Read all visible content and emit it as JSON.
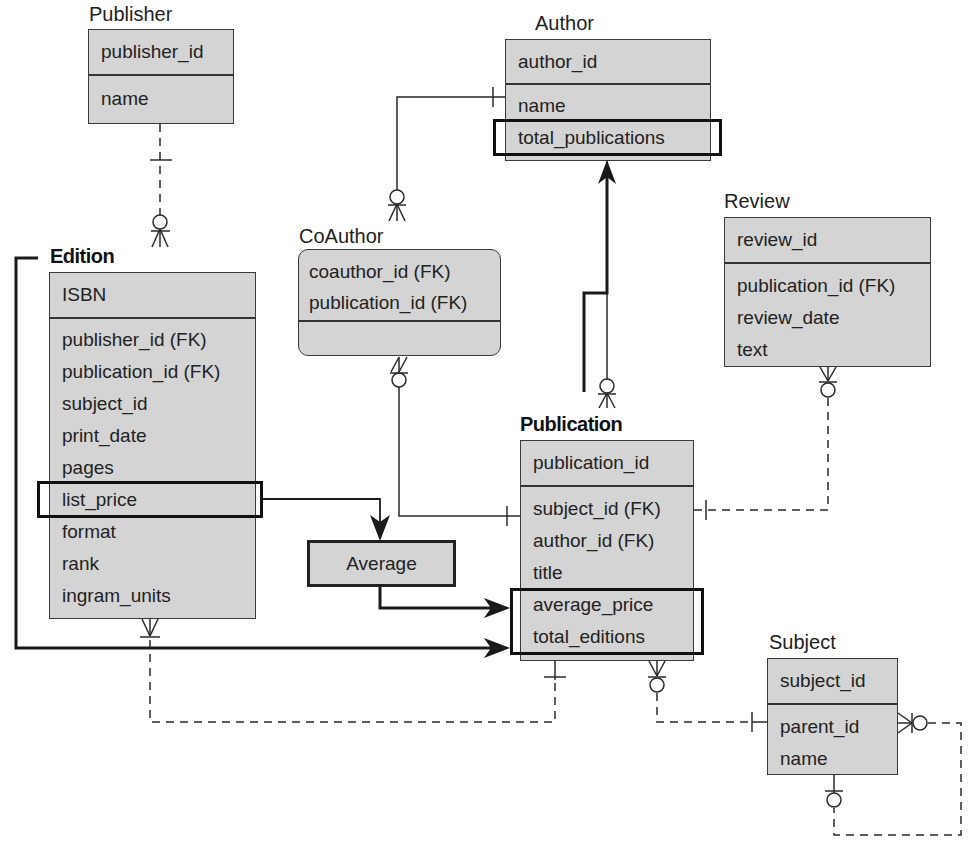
{
  "diagram": {
    "type": "entity-relationship",
    "colors": {
      "entity_fill": "#d4d4d4",
      "line": "#222222",
      "highlight_border": "#111111"
    }
  },
  "entities": {
    "publisher": {
      "title": "Publisher",
      "key": [
        "publisher_id"
      ],
      "attributes": [
        "name"
      ]
    },
    "author": {
      "title": "Author",
      "key": [
        "author_id"
      ],
      "attributes": [
        "name",
        "total_publications"
      ]
    },
    "coauthor": {
      "title": "CoAuthor",
      "key": [
        "coauthor_id (FK)",
        "publication_id (FK)"
      ],
      "attributes": []
    },
    "review": {
      "title": "Review",
      "key": [
        "review_id"
      ],
      "attributes": [
        "publication_id (FK)",
        "review_date",
        "text"
      ]
    },
    "edition": {
      "title": "Edition",
      "key": [
        "ISBN"
      ],
      "attributes": [
        "publisher_id (FK)",
        "publication_id (FK)",
        "subject_id",
        "print_date",
        "pages",
        "list_price",
        "format",
        "rank",
        "ingram_units"
      ]
    },
    "publication": {
      "title": "Publication",
      "key": [
        "publication_id"
      ],
      "attributes": [
        "subject_id (FK)",
        "author_id (FK)",
        "title",
        "average_price",
        "total_editions"
      ]
    },
    "subject": {
      "title": "Subject",
      "key": [
        "subject_id"
      ],
      "attributes": [
        "parent_id",
        "name"
      ]
    }
  },
  "derived": {
    "average": {
      "label": "Average"
    }
  },
  "highlights": [
    {
      "entity": "author",
      "fields": [
        "total_publications"
      ]
    },
    {
      "entity": "edition",
      "fields": [
        "list_price"
      ]
    },
    {
      "entity": "publication",
      "fields": [
        "average_price",
        "total_editions"
      ]
    }
  ],
  "relationships": [
    {
      "from": "Publisher",
      "to": "Edition",
      "style": "dashed",
      "from_card": "one",
      "to_card": "zero-or-many"
    },
    {
      "from": "Author",
      "to": "CoAuthor",
      "style": "solid",
      "from_card": "one",
      "to_card": "zero-or-many"
    },
    {
      "from": "CoAuthor",
      "to": "Publication",
      "style": "solid",
      "from_card": "zero-or-many",
      "to_card": "one"
    },
    {
      "from": "Publication",
      "to": "Author",
      "style": "solid",
      "from_card": "zero-or-many",
      "to_card": "one"
    },
    {
      "from": "Review",
      "to": "Publication",
      "style": "dashed",
      "from_card": "zero-or-many",
      "to_card": "one"
    },
    {
      "from": "Edition",
      "to": "Publication",
      "style": "dashed",
      "from_card": "one-or-many",
      "to_card": "one"
    },
    {
      "from": "Publication",
      "to": "Subject",
      "style": "dashed",
      "from_card": "zero-or-many",
      "to_card": "one"
    },
    {
      "from": "Subject",
      "to": "Subject",
      "style": "dashed",
      "from_card": "zero-or-many",
      "to_card": "zero-or-one"
    }
  ],
  "data_flows": [
    {
      "from": "Edition.list_price",
      "to": "Average"
    },
    {
      "from": "Average",
      "to": "Publication.average_price"
    },
    {
      "from": "Edition",
      "to": "Publication.total_editions"
    },
    {
      "from": "Publication",
      "to": "Author.total_publications"
    }
  ]
}
